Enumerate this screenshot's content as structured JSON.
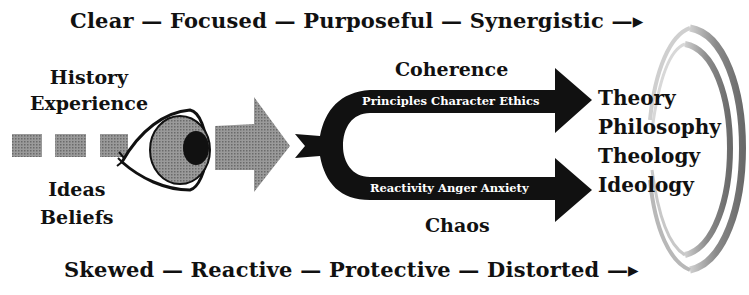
{
  "diagram": {
    "top_line": {
      "terms": [
        "Clear",
        "Focused",
        "Purposeful",
        "Synergistic"
      ],
      "text": "Clear — Focused — Purposeful — Synergistic —▸"
    },
    "bottom_line": {
      "terms": [
        "Skewed",
        "Reactive",
        "Protective",
        "Distorted"
      ],
      "text": "Skewed — Reactive — Protective — Distorted —▸"
    },
    "left_inputs_top": [
      "History",
      "Experience"
    ],
    "left_inputs_bottom": [
      "Ideas",
      "Beliefs"
    ],
    "center": {
      "eye_icon": "eye-icon",
      "gray_arrow": "arrow-right-icon"
    },
    "branches": {
      "upper": {
        "heading": "Coherence",
        "arm_text": "Principles Character Ethics"
      },
      "lower": {
        "heading": "Chaos",
        "arm_text": "Reactivity Anger Anxiety"
      }
    },
    "outcomes": [
      "Theory",
      "Philosophy",
      "Theology",
      "Ideology"
    ],
    "colors": {
      "ink": "#111111",
      "gray_fill": "#8a8a8a",
      "background": "#ffffff"
    }
  }
}
